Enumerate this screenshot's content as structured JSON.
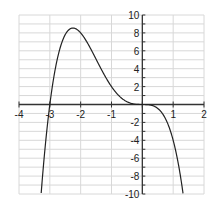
{
  "chart_data": {
    "type": "line",
    "title": "",
    "xlabel": "",
    "ylabel": "",
    "xlim": [
      -4,
      2
    ],
    "ylim": [
      -10,
      10
    ],
    "grid": true,
    "legend": null,
    "x_ticks": [
      "-4",
      "-3",
      "-2",
      "-1",
      "1",
      "2"
    ],
    "y_ticks": [
      "10",
      "8",
      "6",
      "4",
      "2",
      "-2",
      "-4",
      "-6",
      "-8",
      "-10"
    ],
    "series": [
      {
        "name": "f(x) = -x^4 - 3x^3",
        "x": [
          -3.3,
          -3.2,
          -3.1,
          -3.0,
          -2.9,
          -2.8,
          -2.7,
          -2.6,
          -2.5,
          -2.4,
          -2.3,
          -2.25,
          -2.2,
          -2.1,
          -2.0,
          -1.8,
          -1.6,
          -1.4,
          -1.2,
          -1.0,
          -0.8,
          -0.6,
          -0.4,
          -0.2,
          0.0,
          0.2,
          0.4,
          0.6,
          0.8,
          1.0,
          1.1,
          1.2,
          1.3
        ],
        "y": [
          -10.78,
          -6.55,
          -2.98,
          0.0,
          2.44,
          4.39,
          5.9,
          7.03,
          7.81,
          8.29,
          8.52,
          8.54,
          8.52,
          8.34,
          8.0,
          7.0,
          5.73,
          4.39,
          3.11,
          2.0,
          1.13,
          0.52,
          0.17,
          0.02,
          0.0,
          -0.03,
          -0.22,
          -0.78,
          -1.95,
          -4.0,
          -5.46,
          -7.26,
          -9.45
        ]
      }
    ],
    "color": "#222222"
  }
}
